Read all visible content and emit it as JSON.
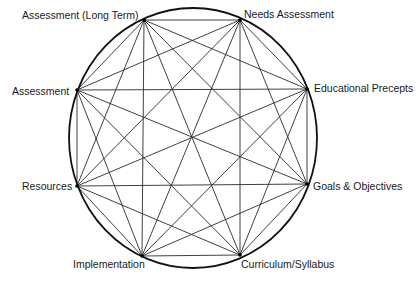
{
  "diagram": {
    "type": "complete-graph-circle",
    "colors": {
      "line": "#2a2a2a",
      "circle": "#111111",
      "text": "#1a1a1a",
      "background": "#ffffff"
    },
    "circle": {
      "cx": 193,
      "cy": 138,
      "rx": 124,
      "ry": 130
    },
    "nodes": [
      {
        "id": "assessment-long-term",
        "label": "Assessment (Long Term)",
        "x": 144,
        "y": 20,
        "label_x": 22,
        "label_y": 9
      },
      {
        "id": "needs-assessment",
        "label": "Needs Assessment",
        "x": 240,
        "y": 20,
        "label_x": 244,
        "label_y": 8
      },
      {
        "id": "educational-precepts",
        "label": "Educational Precepts",
        "x": 307,
        "y": 89,
        "label_x": 314,
        "label_y": 82
      },
      {
        "id": "goals-objectives",
        "label": "Goals & Objectives",
        "x": 307,
        "y": 184,
        "label_x": 313,
        "label_y": 180
      },
      {
        "id": "curriculum-syllabus",
        "label": "Curriculum/Syllabus",
        "x": 240,
        "y": 255,
        "label_x": 241,
        "label_y": 258
      },
      {
        "id": "implementation",
        "label": "Implementation",
        "x": 142,
        "y": 256,
        "label_x": 73,
        "label_y": 258
      },
      {
        "id": "resources",
        "label": "Resources",
        "x": 77,
        "y": 186,
        "label_x": 22,
        "label_y": 180
      },
      {
        "id": "assessment",
        "label": "Assessment",
        "x": 77,
        "y": 90,
        "label_x": 12,
        "label_y": 85
      }
    ],
    "edges": "all-pairs"
  }
}
